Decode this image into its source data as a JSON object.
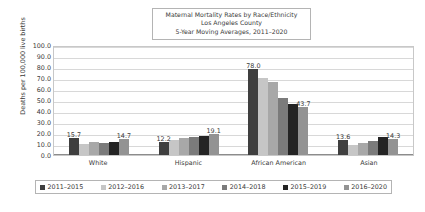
{
  "title": {
    "line1": "Maternal Mortality Rates by Race/Ethnicity",
    "line2": "Los Angeles County",
    "line3": "5-Year Moving Averages, 2011–2020"
  },
  "axis": {
    "ylabel": "Deaths per 100,000 live births",
    "yticks": [
      "100.0",
      "90.0",
      "80.0",
      "70.0",
      "60.0",
      "50.0",
      "40.0",
      "30.0",
      "20.0",
      "10.0",
      "0.0"
    ]
  },
  "colors": {
    "series": [
      "#3f3f3f",
      "#c6c6c6",
      "#a8a8a8",
      "#7b7b7b",
      "#242424",
      "#939393"
    ],
    "gridline": "#d8d8d8",
    "plot_border": "#c8c8c8",
    "text": "#3a3a3a"
  },
  "chart_data": {
    "type": "bar",
    "title": "Maternal Mortality Rates by Race/Ethnicity Los Angeles County 5-Year Moving Averages, 2011–2020",
    "xlabel": "",
    "ylabel": "Deaths per 100,000 live births",
    "ylim": [
      0,
      100
    ],
    "ytick_step": 10,
    "grid": true,
    "legend_position": "bottom",
    "categories": [
      "White",
      "Hispanic",
      "African American",
      "Asian"
    ],
    "series": [
      {
        "name": "2011–2015",
        "values": [
          15.7,
          12.2,
          78.0,
          13.6
        ]
      },
      {
        "name": "2012–2016",
        "values": [
          10.0,
          14.0,
          70.0,
          9.5
        ]
      },
      {
        "name": "2013–2017",
        "values": [
          12.0,
          15.4,
          66.0,
          10.6
        ]
      },
      {
        "name": "2014–2018",
        "values": [
          10.6,
          16.4,
          52.0,
          13.0
        ]
      },
      {
        "name": "2015–2019",
        "values": [
          12.0,
          17.4,
          46.0,
          16.4
        ]
      },
      {
        "name": "2016–2020",
        "values": [
          14.7,
          19.1,
          43.7,
          14.3
        ]
      }
    ],
    "point_labels": [
      {
        "category": "White",
        "series": "2011–2015",
        "text": "15.7"
      },
      {
        "category": "White",
        "series": "2016–2020",
        "text": "14.7"
      },
      {
        "category": "Hispanic",
        "series": "2011–2015",
        "text": "12.2"
      },
      {
        "category": "Hispanic",
        "series": "2016–2020",
        "text": "19.1"
      },
      {
        "category": "African American",
        "series": "2011–2015",
        "text": "78.0"
      },
      {
        "category": "African American",
        "series": "2016–2020",
        "text": "43.7"
      },
      {
        "category": "Asian",
        "series": "2011–2015",
        "text": "13.6"
      },
      {
        "category": "Asian",
        "series": "2016–2020",
        "text": "14.3"
      }
    ]
  }
}
